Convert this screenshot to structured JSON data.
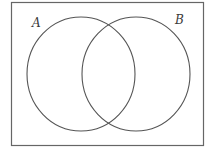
{
  "diagram": {
    "type": "venn",
    "sets": [
      {
        "label": "A"
      },
      {
        "label": "B"
      }
    ],
    "stroke_color": "#555555",
    "background": "#ffffff"
  }
}
